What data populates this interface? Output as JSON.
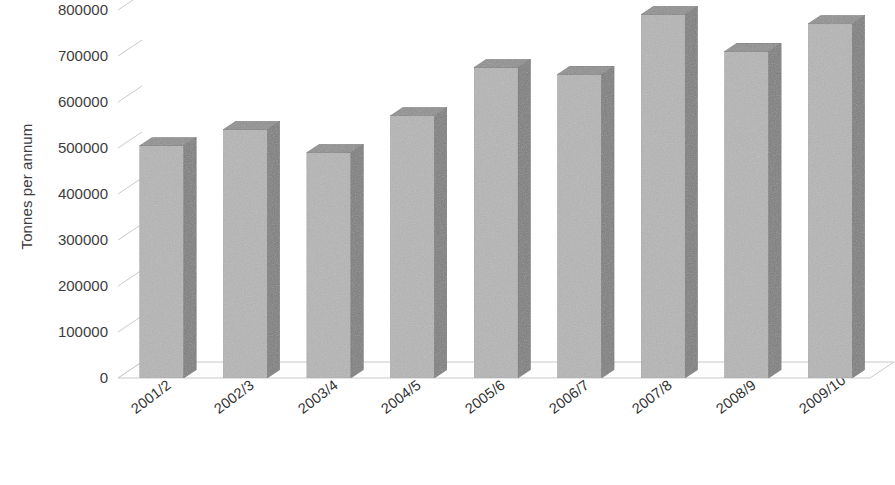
{
  "chart_data": {
    "type": "bar",
    "title": "",
    "subtitle": "",
    "xlabel": "",
    "ylabel": "Tonnes per annum",
    "categories": [
      "2001/2",
      "2002/3",
      "2003/4",
      "2004/5",
      "2005/6",
      "2006/7",
      "2007/8",
      "2008/9",
      "2009/10 est"
    ],
    "values": [
      505000,
      540000,
      490000,
      570000,
      675000,
      660000,
      790000,
      710000,
      770000
    ],
    "series": [
      {
        "name": "Tonnes per annum",
        "values": [
          505000,
          540000,
          490000,
          570000,
          675000,
          660000,
          790000,
          710000,
          770000
        ]
      }
    ],
    "ylim": [
      0,
      800000
    ],
    "ytick_values": [
      0,
      100000,
      200000,
      300000,
      400000,
      500000,
      600000,
      700000,
      800000
    ],
    "ytick_labels": [
      "0",
      "100000",
      "200000",
      "300000",
      "400000",
      "500000",
      "600000",
      "700000",
      "800000"
    ],
    "grid": true,
    "grid_axis": "y",
    "legend": false,
    "legend_position": "none",
    "style": "3d-column",
    "colors": {
      "bar_front": "#b5b5b5",
      "bar_side": "#7d7d7d",
      "bar_top": "#8f8f8f",
      "gridline": "#c9c9c9",
      "axis_line": "#9a9a9a",
      "text": "#333333",
      "background": "#ffffff",
      "floor": "#fdfdfd"
    }
  }
}
